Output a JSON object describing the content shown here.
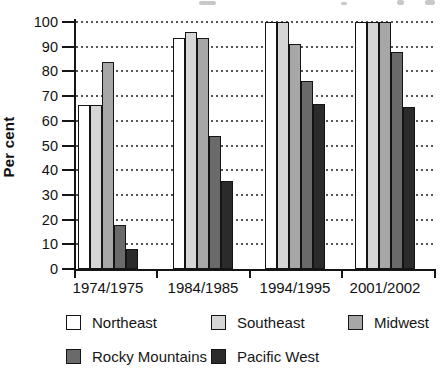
{
  "y_axis": {
    "title": "Per cent",
    "ticks": [
      0,
      10,
      20,
      30,
      40,
      50,
      60,
      70,
      80,
      90,
      100
    ]
  },
  "x_axis": {
    "categories": [
      "1974/1975",
      "1984/1985",
      "1994/1995",
      "2001/2002"
    ]
  },
  "legend": {
    "items": [
      {
        "label": "Northeast",
        "color": "#ffffff"
      },
      {
        "label": "Southeast",
        "color": "#d6d6d6"
      },
      {
        "label": "Midwest",
        "color": "#a7a7a7"
      },
      {
        "label": "Rocky Mountains",
        "color": "#6a6a6a"
      },
      {
        "label": "Pacific West",
        "color": "#2b2b2b"
      }
    ]
  },
  "chart_data": {
    "type": "bar",
    "categories": [
      "1974/1975",
      "1984/1985",
      "1994/1995",
      "2001/2002"
    ],
    "series": [
      {
        "name": "Northeast",
        "color": "#ffffff",
        "values": [
          66.5,
          93.5,
          100,
          100
        ]
      },
      {
        "name": "Southeast",
        "color": "#d6d6d6",
        "values": [
          66.5,
          96,
          100,
          100
        ]
      },
      {
        "name": "Midwest",
        "color": "#a7a7a7",
        "values": [
          84,
          93.5,
          91,
          100
        ]
      },
      {
        "name": "Rocky Mountains",
        "color": "#6a6a6a",
        "values": [
          18,
          54,
          76,
          88
        ]
      },
      {
        "name": "Pacific West",
        "color": "#2b2b2b",
        "values": [
          8,
          35.5,
          67,
          65.5
        ]
      }
    ],
    "title": "",
    "xlabel": "",
    "ylabel": "Per cent",
    "ylim": [
      0,
      100
    ],
    "grid": "dotted-horizontal",
    "legend_position": "bottom",
    "axis_color": "#151515",
    "bar_border_color": "#141414"
  },
  "artifacts": {
    "top_edge_cropped_text": true
  }
}
